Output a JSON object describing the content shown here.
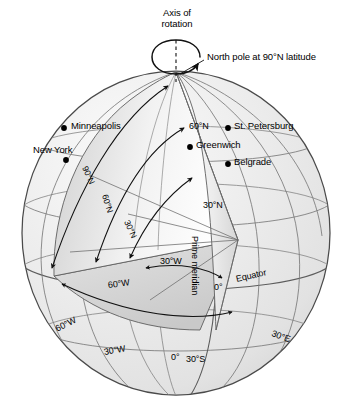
{
  "diagram": {
    "title_text": "Axis of rotation",
    "type": "globe-latitude-longitude-diagram",
    "colors": {
      "globe_fill": "#e9e9e9",
      "globe_fill_light": "#f6f6f6",
      "wedge_fill": "#fbfbfb",
      "grid_line": "#6b6b6b",
      "outline": "#3a3a3a",
      "text": "#000000",
      "dot": "#000000"
    }
  },
  "annotations": {
    "axis_of_rotation_line1": "Axis of",
    "axis_of_rotation_line2": "rotation",
    "north_pole": "North pole at 90°N latitude",
    "prime_meridian": "Prime meridian",
    "equator": "Equator"
  },
  "cities": [
    {
      "name": "Minneapolis",
      "dot_x": 64,
      "dot_y": 128,
      "label_x": 71,
      "label_y": 121,
      "align": "right-of-dot"
    },
    {
      "name": "New York",
      "dot_x": 66,
      "dot_y": 160,
      "label_x": 36,
      "label_y": 145,
      "align": "above-dot"
    },
    {
      "name": "St. Petersburg",
      "dot_x": 228,
      "dot_y": 128,
      "label_x": 234,
      "label_y": 121,
      "align": "right-of-dot"
    },
    {
      "name": "Greenwich",
      "dot_x": 190,
      "dot_y": 147,
      "label_x": 196,
      "label_y": 140,
      "align": "right-of-dot"
    },
    {
      "name": "Belgrade",
      "dot_x": 228,
      "dot_y": 164,
      "label_x": 234,
      "label_y": 157,
      "align": "right-of-dot"
    }
  ],
  "latitude_labels": [
    {
      "text": "60°N",
      "x": 191,
      "y": 122,
      "rotation": 0
    },
    {
      "text": "30°N",
      "x": 203,
      "y": 206,
      "rotation": 0
    },
    {
      "text": "0°",
      "x": 215,
      "y": 288,
      "rotation": 0
    },
    {
      "text": "30°S",
      "x": 189,
      "y": 360,
      "rotation": 0
    }
  ],
  "longitude_labels": [
    {
      "text": "60°W",
      "x": 56,
      "y": 330,
      "rotation": -28
    },
    {
      "text": "30°W",
      "x": 106,
      "y": 352,
      "rotation": -12
    },
    {
      "text": "0°",
      "x": 173,
      "y": 358,
      "rotation": 0
    },
    {
      "text": "30°E",
      "x": 276,
      "y": 333,
      "rotation": 22
    }
  ],
  "interior_arc_labels": [
    {
      "text": "90°N",
      "x": 88,
      "y": 168,
      "rotation": 66
    },
    {
      "text": "60°N",
      "x": 108,
      "y": 196,
      "rotation": 74
    },
    {
      "text": "30°N",
      "x": 130,
      "y": 222,
      "rotation": 68
    },
    {
      "text": "30°W",
      "x": 163,
      "y": 268,
      "rotation": 0
    },
    {
      "text": "60°W",
      "x": 112,
      "y": 286,
      "rotation": -8
    }
  ]
}
